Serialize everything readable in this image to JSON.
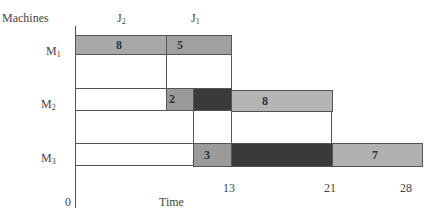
{
  "diagram": {
    "type": "gantt",
    "y_axis_title": "Machines",
    "x_axis_title": "Time",
    "origin_label": "0",
    "columns": [
      {
        "label": "J",
        "sub": "2"
      },
      {
        "label": "J",
        "sub": "1"
      }
    ],
    "machines": [
      {
        "label": "M",
        "sub": "1"
      },
      {
        "label": "M",
        "sub": "2"
      },
      {
        "label": "M",
        "sub": "3"
      }
    ],
    "tasks": {
      "m1_j2": "8",
      "m1_j1": "5",
      "m2_j1": "2",
      "m2_j2": "8",
      "m3_j1": "3",
      "m3_j2": "7"
    },
    "time_ticks": [
      "13",
      "21",
      "28"
    ],
    "colors": {
      "task_gray": "#a8a8a8",
      "task_gray_light": "#b5b5b5",
      "idle_dark": "#3a3a3a",
      "idle_white": "#ffffff",
      "line": "#555555"
    }
  }
}
